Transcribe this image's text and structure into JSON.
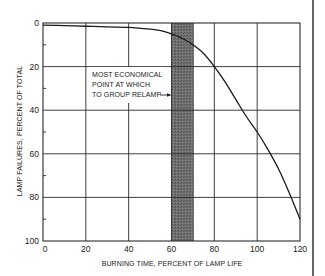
{
  "chart_data": {
    "type": "line",
    "title": "",
    "xlabel": "BURNING TIME, PERCENT OF LAMP LIFE",
    "ylabel": "LAMP FAILURES, PERCENT OF TOTAL",
    "xlim": [
      0,
      120
    ],
    "ylim": [
      0,
      100
    ],
    "y_inverted": true,
    "x_ticks": [
      0,
      20,
      40,
      60,
      80,
      100,
      120
    ],
    "y_ticks": [
      0,
      20,
      40,
      60,
      80,
      100
    ],
    "y_minor_ticks": [
      10,
      30,
      50,
      70,
      90
    ],
    "grid": true,
    "legend": null,
    "series": [
      {
        "name": "Lamp failures",
        "x": [
          0,
          10,
          20,
          30,
          40,
          50,
          55,
          60,
          65,
          70,
          75,
          80,
          85,
          90,
          95,
          100,
          105,
          110,
          115,
          120
        ],
        "y": [
          1,
          1.2,
          1.5,
          1.8,
          2,
          2.8,
          3.5,
          5,
          7,
          10,
          14,
          20,
          27,
          35,
          43,
          50,
          58,
          67,
          78,
          90
        ]
      }
    ],
    "shaded_regions": [
      {
        "x_start": 60,
        "x_end": 70,
        "color": "#6e6e6e"
      }
    ],
    "annotations": [
      {
        "text_lines": [
          "MOST ECONOMICAL",
          "POINT AT WHICH",
          "TO GROUP RELAMP"
        ],
        "arrow_to": "shaded band at x=60",
        "arrow_y": 37
      }
    ]
  },
  "labels": {
    "x_axis_title": "BURNING TIME, PERCENT OF LAMP LIFE",
    "y_axis_title": "LAMP FAILURES, PERCENT OF TOTAL",
    "annotation_line1": "MOST ECONOMICAL",
    "annotation_line2": "POINT AT WHICH",
    "annotation_line3": "TO GROUP RELAMP",
    "x_ticks": [
      "0",
      "20",
      "40",
      "60",
      "80",
      "100",
      "120"
    ],
    "y_ticks": [
      "0",
      "20",
      "40",
      "60",
      "80",
      "100"
    ]
  },
  "colors": {
    "line": "#1a1a1a",
    "grid": "#2a2a2a",
    "band": "#6e6e6e",
    "background": "#ffffff"
  }
}
